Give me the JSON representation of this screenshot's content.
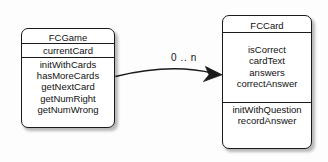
{
  "diagram": {
    "type": "uml-class-diagram",
    "background_color": "#fdfdfd",
    "line_color": "#1a1a1a",
    "text_color": "#111111"
  },
  "classes": [
    {
      "id": "fcgame",
      "name": "FCGame",
      "attributes": [
        "currentCard"
      ],
      "operations": [
        "initWithCards",
        "hasMoreCards",
        "getNextCard",
        "getNumRight",
        "getNumWrong"
      ]
    },
    {
      "id": "fccard",
      "name": "FCCard",
      "attributes": [
        "isCorrect",
        "cardText",
        "answers",
        "correctAnswer"
      ],
      "operations": [
        "initWithQuestion",
        "recordAnswer"
      ]
    }
  ],
  "association": {
    "from": "fcgame",
    "to": "fccard",
    "multiplicity": "0 .. n",
    "arrow": "open-directed"
  }
}
